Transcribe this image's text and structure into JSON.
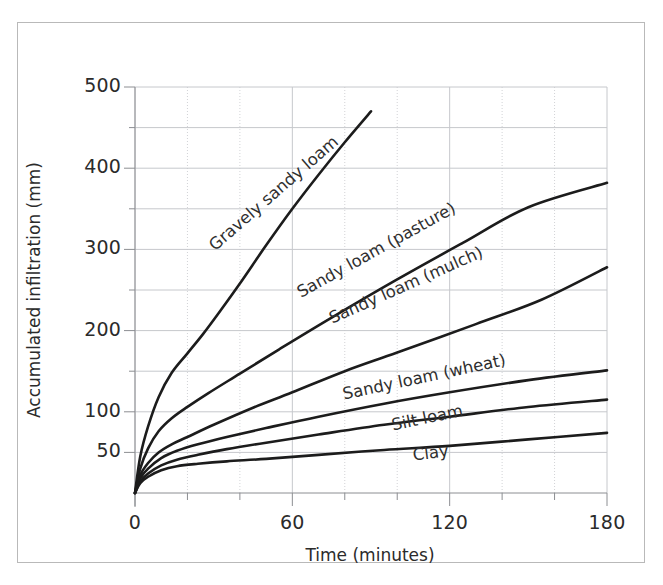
{
  "chart_data": {
    "type": "line",
    "title": "",
    "xlabel": "Time (minutes)",
    "ylabel": "Accumulated infiltration (mm)",
    "xlim": [
      0,
      180
    ],
    "ylim": [
      0,
      500
    ],
    "x_ticks": [
      0,
      60,
      120,
      180
    ],
    "x_tick_labels": [
      "0",
      "60",
      "120",
      "180"
    ],
    "x_minor_step": 20,
    "y_ticks": [
      50,
      100,
      150,
      200,
      250,
      300,
      350,
      400,
      450,
      500
    ],
    "y_tick_labels": [
      "50",
      "100",
      "",
      "200",
      "",
      "300",
      "",
      "400",
      "",
      "500"
    ],
    "y_labeled_ticks": [
      50,
      100,
      200,
      300,
      400,
      500
    ],
    "grid": true,
    "legend_position": "inline-labels",
    "line_color": "#1c1c1c",
    "grid_color": "#c6c8cc",
    "frame_color": "#b9b9b9",
    "series": [
      {
        "name": "Gravely sandy loam",
        "label_x": 300,
        "label_y": 245,
        "label_angle": -41,
        "x": [
          0,
          2,
          5,
          9,
          14,
          20,
          26,
          32,
          40,
          50,
          60,
          70,
          80,
          90
        ],
        "values": [
          0,
          45,
          82,
          118,
          148,
          172,
          196,
          222,
          258,
          305,
          350,
          392,
          432,
          470
        ]
      },
      {
        "name": "Sandy loam (pasture)",
        "label_x": 392,
        "label_y": 292,
        "label_angle": -29,
        "x": [
          0,
          2,
          5,
          9,
          14,
          20,
          28,
          40,
          55,
          75,
          100,
          125,
          150,
          180
        ],
        "values": [
          0,
          30,
          55,
          76,
          92,
          106,
          123,
          147,
          177,
          216,
          263,
          308,
          352,
          382
        ]
      },
      {
        "name": "Sandy loam (mulch)",
        "label_x": 417,
        "label_y": 318,
        "label_angle": -24,
        "x": [
          0,
          2,
          5,
          9,
          14,
          20,
          30,
          45,
          60,
          80,
          100,
          130,
          155,
          180
        ],
        "values": [
          0,
          22,
          37,
          50,
          60,
          69,
          84,
          105,
          124,
          150,
          173,
          208,
          238,
          278
        ]
      },
      {
        "name": "Sandy loam (wheat)",
        "label_x": 428,
        "label_y": 394,
        "label_angle": -12,
        "x": [
          0,
          2,
          5,
          10,
          16,
          24,
          35,
          50,
          70,
          95,
          120,
          150,
          180
        ],
        "values": [
          0,
          18,
          30,
          43,
          52,
          60,
          69,
          80,
          94,
          110,
          124,
          139,
          151
        ]
      },
      {
        "name": "Silt loam",
        "label_x": 430,
        "label_y": 425,
        "label_angle": -12,
        "x": [
          0,
          2,
          5,
          10,
          16,
          24,
          35,
          50,
          70,
          95,
          120,
          150,
          180
        ],
        "values": [
          0,
          14,
          24,
          34,
          41,
          47,
          54,
          62,
          72,
          84,
          94,
          106,
          115
        ]
      },
      {
        "name": "Clay",
        "label_x": 432,
        "label_y": 455,
        "label_angle": -7,
        "x": [
          0,
          2,
          5,
          10,
          16,
          24,
          35,
          50,
          70,
          95,
          120,
          150,
          180
        ],
        "values": [
          0,
          12,
          20,
          28,
          33,
          36,
          39,
          42,
          47,
          53,
          58,
          66,
          74
        ]
      }
    ]
  },
  "axes": {
    "y_tick_texts": [
      "500",
      "400",
      "300",
      "200",
      "100",
      "50"
    ],
    "x_tick_texts": [
      "0",
      "60",
      "120",
      "180"
    ]
  }
}
